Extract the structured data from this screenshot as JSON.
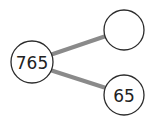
{
  "diagram": {
    "type": "number-bond",
    "whole": {
      "label": "765"
    },
    "parts": [
      {
        "label": ""
      },
      {
        "label": "65"
      }
    ],
    "colors": {
      "line": "#8a8a8a",
      "circle_stroke": "#2b2b2b",
      "text": "#222222",
      "background": "#ffffff"
    }
  }
}
